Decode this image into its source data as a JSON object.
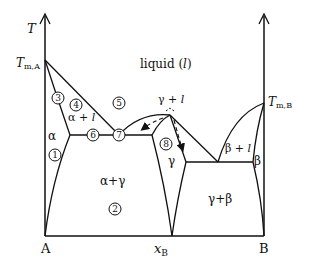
{
  "axes": {
    "y_label": "T",
    "left_label": "A",
    "right_label": "B",
    "x_label": "x",
    "x_label_sub": "B",
    "tm_a": "T",
    "tm_a_sub": "m,A",
    "tm_b": "T",
    "tm_b_sub": "m,B"
  },
  "regions": {
    "liquid": "liquid (",
    "liquid_l": "l",
    "liquid_close": ")",
    "alpha": "α",
    "alpha_plus_l": "α + ",
    "gamma_plus_l": "γ + ",
    "gamma": "γ",
    "beta": "β",
    "beta_plus_l": "β + ",
    "alpha_gamma": "α+γ",
    "gamma_beta": "γ+β",
    "l": "l"
  },
  "markers": [
    "1",
    "2",
    "3",
    "4",
    "5",
    "6",
    "7",
    "8"
  ],
  "colors": {
    "line": "#111111",
    "background": "#ffffff"
  }
}
